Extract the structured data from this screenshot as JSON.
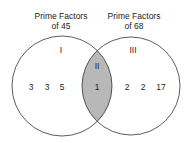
{
  "diagram": {
    "type": "venn",
    "sets": [
      {
        "title_line1": "Prime Factors",
        "title_line2": "of 45",
        "region_label": "I",
        "elements": [
          "3",
          "3",
          "5"
        ]
      },
      {
        "title_line1": "Prime Factors",
        "title_line2": "of 68",
        "region_label": "III",
        "elements": [
          "2",
          "2",
          "17"
        ]
      }
    ],
    "intersection": {
      "region_label": "II",
      "elements": [
        "1"
      ],
      "fill": "#b8b8b8"
    },
    "colors": {
      "stroke": "#333333",
      "background": "#ffffff"
    }
  }
}
